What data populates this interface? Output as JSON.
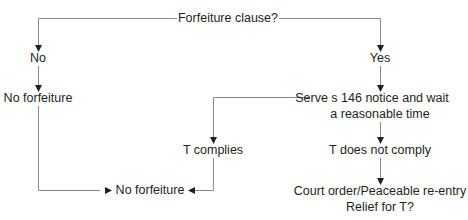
{
  "diagram": {
    "type": "flowchart",
    "line_color": "#8a8a8a",
    "arrow_color": "#231f20",
    "nodes": {
      "start": "Forfeiture clause?",
      "no": "No",
      "yes": "Yes",
      "no_forfeiture_left": "No forfeiture",
      "serve_line1": "Serve s 146 notice and wait",
      "serve_line2": "a reasonable time",
      "t_complies": "T complies",
      "t_not_comply": "T does not comply",
      "no_forfeiture_bottom": "No forfeiture",
      "court_line1": "Court order/Peaceable re-entry",
      "court_line2": "Relief for T?"
    },
    "edges": [
      {
        "from": "start",
        "to": "no"
      },
      {
        "from": "start",
        "to": "yes"
      },
      {
        "from": "no",
        "to": "no_forfeiture_left"
      },
      {
        "from": "no_forfeiture_left",
        "to": "no_forfeiture_bottom"
      },
      {
        "from": "yes",
        "to": "serve"
      },
      {
        "from": "serve",
        "to": "t_complies"
      },
      {
        "from": "serve",
        "to": "t_not_comply"
      },
      {
        "from": "t_complies",
        "to": "no_forfeiture_bottom"
      },
      {
        "from": "t_not_comply",
        "to": "court"
      }
    ]
  }
}
